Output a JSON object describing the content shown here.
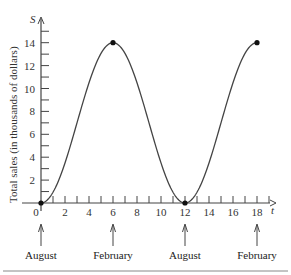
{
  "chart_data": {
    "type": "line",
    "title": "",
    "xlabel": "t",
    "ylabel": "Total sales (in thousands of dollars)",
    "y_axis_name": "S",
    "xlim": [
      0,
      19
    ],
    "ylim": [
      0,
      16
    ],
    "x_ticks": [
      0,
      2,
      4,
      6,
      8,
      10,
      12,
      14,
      16,
      18
    ],
    "y_ticks": [
      2,
      4,
      6,
      8,
      10,
      12,
      14
    ],
    "series": [
      {
        "name": "S(t) = 7 - 7cos(pi t / 6)",
        "x": [
          0,
          1,
          2,
          3,
          4,
          5,
          6,
          7,
          8,
          9,
          10,
          11,
          12,
          13,
          14,
          15,
          16,
          17,
          18
        ],
        "values": [
          0,
          0.94,
          3.5,
          7,
          10.5,
          13.06,
          14,
          13.06,
          10.5,
          7,
          3.5,
          0.94,
          0,
          0.94,
          3.5,
          7,
          10.5,
          13.06,
          14
        ]
      }
    ],
    "marked_points": [
      [
        0,
        0
      ],
      [
        6,
        14
      ],
      [
        12,
        0
      ],
      [
        18,
        14
      ]
    ],
    "annotations": [
      {
        "x": 0,
        "label": "August"
      },
      {
        "x": 6,
        "label": "February"
      },
      {
        "x": 12,
        "label": "August"
      },
      {
        "x": 18,
        "label": "February"
      }
    ],
    "grid": false,
    "legend": "none"
  }
}
